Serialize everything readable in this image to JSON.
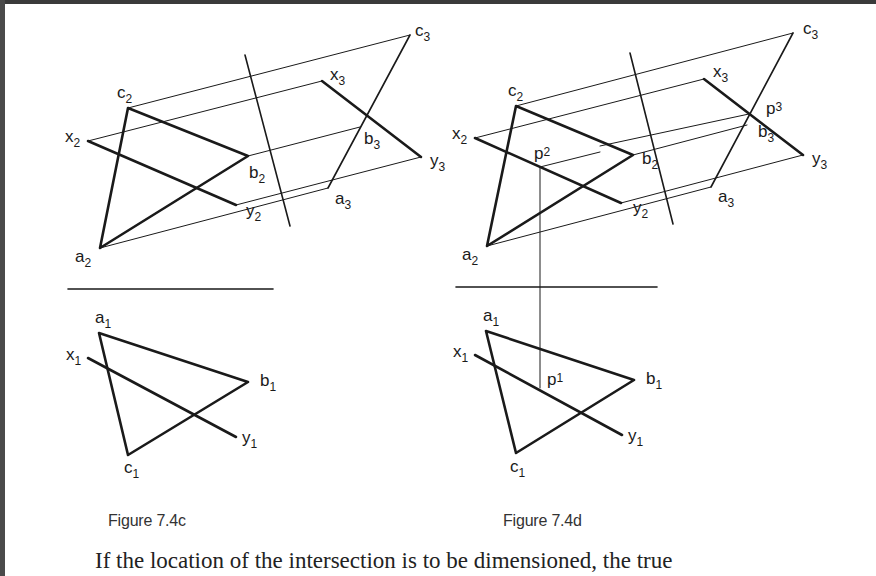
{
  "figures": [
    {
      "id": "7.4c",
      "caption": "Figure 7.4c",
      "labels": {
        "c2": {
          "base": "c",
          "sub": "2"
        },
        "x2": {
          "base": "x",
          "sub": "2"
        },
        "b2": {
          "base": "b",
          "sub": "2"
        },
        "y2": {
          "base": "y",
          "sub": "2"
        },
        "a2": {
          "base": "a",
          "sub": "2"
        },
        "c3": {
          "base": "c",
          "sub": "3"
        },
        "x3": {
          "base": "x",
          "sub": "3"
        },
        "b3": {
          "base": "b",
          "sub": "3"
        },
        "y3": {
          "base": "y",
          "sub": "3"
        },
        "a3": {
          "base": "a",
          "sub": "3"
        },
        "a1": {
          "base": "a",
          "sub": "1"
        },
        "x1": {
          "base": "x",
          "sub": "1"
        },
        "b1": {
          "base": "b",
          "sub": "1"
        },
        "y1": {
          "base": "y",
          "sub": "1"
        },
        "c1": {
          "base": "c",
          "sub": "1"
        }
      }
    },
    {
      "id": "7.4d",
      "caption": "Figure 7.4d",
      "labels": {
        "c2": {
          "base": "c",
          "sub": "2"
        },
        "x2": {
          "base": "x",
          "sub": "2"
        },
        "p2": {
          "base": "p",
          "sub": "2"
        },
        "b2": {
          "base": "b",
          "sub": "2"
        },
        "y2": {
          "base": "y",
          "sub": "2"
        },
        "a2": {
          "base": "a",
          "sub": "2"
        },
        "c3": {
          "base": "c",
          "sub": "3"
        },
        "x3": {
          "base": "x",
          "sub": "3"
        },
        "p3": {
          "base": "p",
          "sub": "3"
        },
        "b3": {
          "base": "b",
          "sub": "3"
        },
        "y3": {
          "base": "y",
          "sub": "3"
        },
        "a3": {
          "base": "a",
          "sub": "3"
        },
        "a1": {
          "base": "a",
          "sub": "1"
        },
        "x1": {
          "base": "x",
          "sub": "1"
        },
        "p1": {
          "base": "p",
          "sub": "1"
        },
        "b1": {
          "base": "b",
          "sub": "1"
        },
        "y1": {
          "base": "y",
          "sub": "1"
        },
        "c1": {
          "base": "c",
          "sub": "1"
        }
      }
    }
  ],
  "body_text": "If the location of the intersection is to be dimensioned, the true"
}
